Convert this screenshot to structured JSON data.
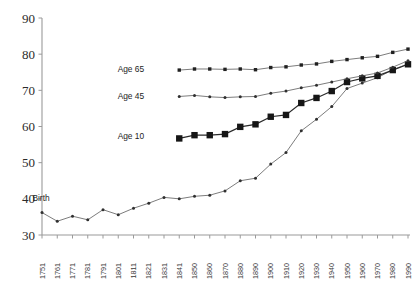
{
  "chart_data": {
    "type": "line",
    "title": "",
    "subtitle": "",
    "xlabel": "",
    "ylabel": "",
    "ylim": [
      30,
      90
    ],
    "yticks": [
      30,
      40,
      50,
      60,
      70,
      80,
      90
    ],
    "grid": false,
    "legend_position": "inline-left-of-series",
    "x_tick_labels": [
      "1751",
      "1761",
      "1771",
      "1781",
      "1791",
      "1801",
      "1811",
      "1821",
      "1831",
      "1841",
      "1850",
      "1860",
      "1870",
      "1880",
      "1890",
      "1900",
      "1910",
      "1920",
      "1930",
      "1940",
      "1950",
      "1960",
      "1970",
      "1980",
      "1990"
    ],
    "annotations": [
      {
        "text": "Birth",
        "x": 1756,
        "y": 40.2
      },
      {
        "text": "Age 10",
        "x": 1818,
        "y": 57.5
      },
      {
        "text": "Age 45",
        "x": 1818,
        "y": 68.5
      },
      {
        "text": "Age 65",
        "x": 1818,
        "y": 76.0
      }
    ],
    "series": [
      {
        "name": "Birth",
        "marker": "small-dot",
        "x": [
          1751,
          1761,
          1771,
          1781,
          1791,
          1801,
          1811,
          1821,
          1831,
          1841,
          1850,
          1860,
          1870,
          1880,
          1890,
          1900,
          1910,
          1920,
          1930,
          1940,
          1950,
          1960,
          1970,
          1980,
          1990
        ],
        "values": [
          36.2,
          33.8,
          35.2,
          34.2,
          37.0,
          35.6,
          37.4,
          38.8,
          40.4,
          40.0,
          40.7,
          41.0,
          42.2,
          45.0,
          45.7,
          49.6,
          52.8,
          58.8,
          62.0,
          65.5,
          70.5,
          72.0,
          73.5,
          75.7,
          77.3
        ]
      },
      {
        "name": "Age 10",
        "marker": "large-square",
        "x": [
          1841,
          1850,
          1860,
          1870,
          1880,
          1890,
          1900,
          1910,
          1920,
          1930,
          1940,
          1950,
          1960,
          1970,
          1980,
          1990
        ],
        "values": [
          56.7,
          57.6,
          57.6,
          57.9,
          59.9,
          60.6,
          62.7,
          63.2,
          66.5,
          67.9,
          69.8,
          72.3,
          73.3,
          74.0,
          75.6,
          77.2
        ]
      },
      {
        "name": "Age 45",
        "marker": "small-dot",
        "x": [
          1841,
          1850,
          1860,
          1870,
          1880,
          1890,
          1900,
          1910,
          1920,
          1930,
          1940,
          1950,
          1960,
          1970,
          1980,
          1990
        ],
        "values": [
          68.3,
          68.6,
          68.2,
          68.0,
          68.2,
          68.3,
          69.2,
          69.8,
          70.7,
          71.4,
          72.3,
          73.2,
          74.0,
          74.8,
          76.4,
          78.2
        ]
      },
      {
        "name": "Age 65",
        "marker": "small-square",
        "x": [
          1841,
          1850,
          1860,
          1870,
          1880,
          1890,
          1900,
          1910,
          1920,
          1930,
          1940,
          1950,
          1960,
          1970,
          1980,
          1990
        ],
        "values": [
          75.6,
          75.9,
          75.9,
          75.8,
          75.9,
          75.7,
          76.3,
          76.5,
          77.0,
          77.3,
          78.0,
          78.5,
          79.0,
          79.4,
          80.5,
          81.4
        ]
      }
    ]
  },
  "geometry": {
    "plot_left": 42,
    "plot_right": 408,
    "plot_top": 18,
    "plot_bottom": 235
  }
}
